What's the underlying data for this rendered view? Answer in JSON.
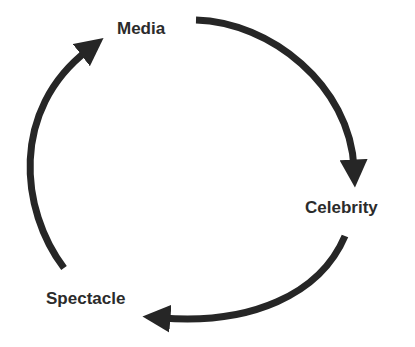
{
  "diagram": {
    "type": "cycle",
    "nodes": [
      {
        "id": "media",
        "label": "Media"
      },
      {
        "id": "celebrity",
        "label": "Celebrity"
      },
      {
        "id": "spectacle",
        "label": "Spectacle"
      }
    ],
    "edges": [
      {
        "from": "media",
        "to": "celebrity"
      },
      {
        "from": "celebrity",
        "to": "spectacle"
      },
      {
        "from": "spectacle",
        "to": "media"
      }
    ],
    "colors": {
      "arrow": "#262626",
      "text": "#2b2b2b",
      "background": "#ffffff"
    }
  }
}
